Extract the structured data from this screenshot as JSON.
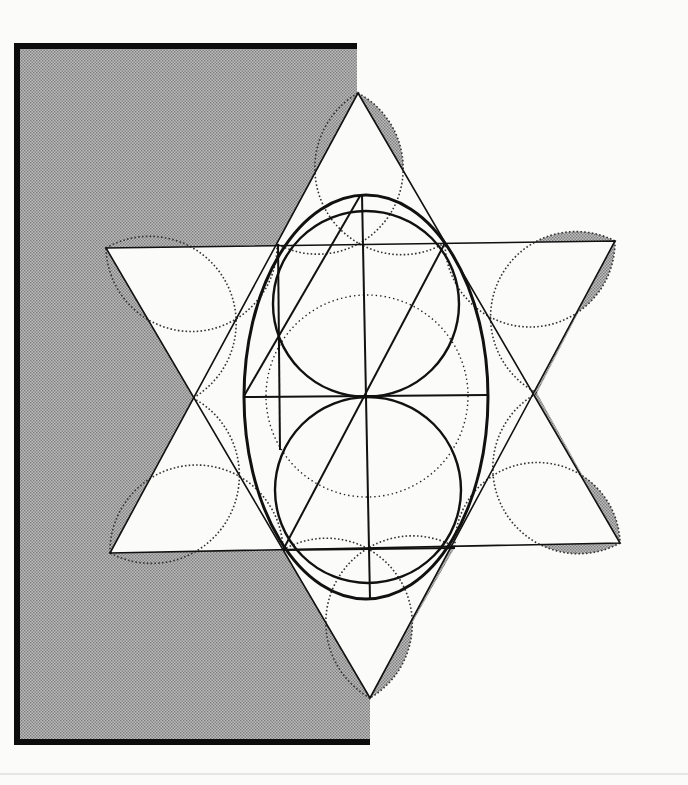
{
  "colors": {
    "paper": "#fbfbfa",
    "shade": "#bdbdbd",
    "shade_dot": "#7a7a7a",
    "ink": "#111111",
    "frame": "#0d0d0d"
  },
  "frame": {
    "left": 14,
    "top": 43,
    "right": 357,
    "bottom_right": 370,
    "bottom": 745,
    "bar": 6
  },
  "hexagram": {
    "up_triangle": [
      [
        358,
        93
      ],
      [
        106,
        248
      ],
      [
        615,
        241
      ]
    ],
    "down_triangle_note": "second triangle of the star",
    "down_triangle": [
      [
        110,
        553
      ],
      [
        620,
        543
      ],
      [
        370,
        698
      ]
    ],
    "up_triangle_lower": [
      [
        106,
        248
      ],
      [
        370,
        698
      ],
      [
        615,
        241
      ]
    ],
    "down_triangle_upper": [
      [
        110,
        553
      ],
      [
        358,
        93
      ],
      [
        620,
        543
      ]
    ]
  },
  "petals": [
    {
      "a": [
        358,
        93
      ],
      "b": [
        277,
        244
      ]
    },
    {
      "a": [
        277,
        244
      ],
      "b": [
        106,
        248
      ]
    },
    {
      "a": [
        106,
        248
      ],
      "b": [
        193,
        398
      ]
    },
    {
      "a": [
        193,
        398
      ],
      "b": [
        110,
        553
      ]
    },
    {
      "a": [
        110,
        553
      ],
      "b": [
        283,
        550
      ]
    },
    {
      "a": [
        283,
        550
      ],
      "b": [
        370,
        698
      ]
    },
    {
      "a": [
        370,
        698
      ],
      "b": [
        455,
        547
      ]
    },
    {
      "a": [
        455,
        547
      ],
      "b": [
        620,
        543
      ]
    },
    {
      "a": [
        620,
        543
      ],
      "b": [
        537,
        393
      ]
    },
    {
      "a": [
        537,
        393
      ],
      "b": [
        615,
        241
      ]
    },
    {
      "a": [
        615,
        241
      ],
      "b": [
        445,
        243
      ]
    },
    {
      "a": [
        445,
        243
      ],
      "b": [
        358,
        93
      ]
    }
  ],
  "ellipse": {
    "cx": 366,
    "cy": 397,
    "rx": 122,
    "ry": 202
  },
  "upper_circle": {
    "cx": 366,
    "cy": 304,
    "r": 93
  },
  "lower_circle": {
    "cx": 368,
    "cy": 490,
    "r": 93
  },
  "dotted_circle": {
    "cx": 367,
    "cy": 396,
    "r": 101
  },
  "lines": [
    {
      "x1": 362,
      "y1": 195,
      "x2": 370,
      "y2": 599,
      "w": 2
    },
    {
      "x1": 278,
      "y1": 244,
      "x2": 280,
      "y2": 450,
      "w": 2
    },
    {
      "x1": 244,
      "y1": 397,
      "x2": 487,
      "y2": 395,
      "w": 2
    },
    {
      "x1": 283,
      "y1": 550,
      "x2": 455,
      "y2": 548,
      "w": 2
    },
    {
      "x1": 360,
      "y1": 196,
      "x2": 244,
      "y2": 396,
      "w": 2
    },
    {
      "x1": 445,
      "y1": 243,
      "x2": 283,
      "y2": 550,
      "w": 2
    }
  ]
}
